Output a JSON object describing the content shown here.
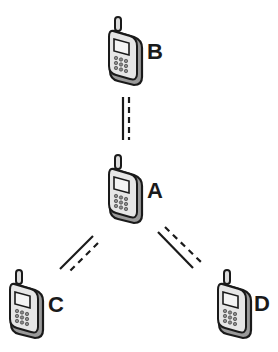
{
  "diagram": {
    "type": "network-topology",
    "nodes": [
      {
        "id": "B",
        "label": "B",
        "icon": "mobile-phone-icon"
      },
      {
        "id": "A",
        "label": "A",
        "icon": "mobile-phone-icon"
      },
      {
        "id": "C",
        "label": "C",
        "icon": "mobile-phone-icon"
      },
      {
        "id": "D",
        "label": "D",
        "icon": "mobile-phone-icon"
      }
    ],
    "edges": [
      {
        "from": "A",
        "to": "B",
        "style": "solid+dashed"
      },
      {
        "from": "A",
        "to": "C",
        "style": "solid+dashed"
      },
      {
        "from": "A",
        "to": "D",
        "style": "solid+dashed"
      }
    ],
    "colors": {
      "stroke": "#1a1a1a",
      "phone_body": "#e6e6e6",
      "screen": "#f2f2f2",
      "shadow": "#9a9a9a"
    }
  }
}
